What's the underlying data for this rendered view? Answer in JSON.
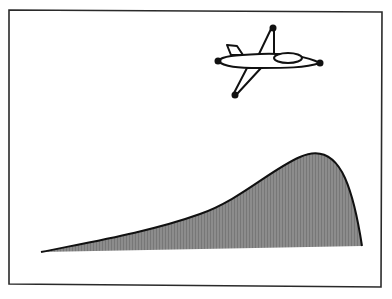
{
  "figure": {
    "colors": {
      "background": "#ffffff",
      "frame": "#2a2a2a",
      "ink": "#111111",
      "fill": "#8a8a8a"
    },
    "objects": [
      {
        "name": "airplane",
        "icon": "airplane-icon"
      },
      {
        "name": "shaded-curve",
        "icon": "area-curve-icon"
      }
    ]
  }
}
